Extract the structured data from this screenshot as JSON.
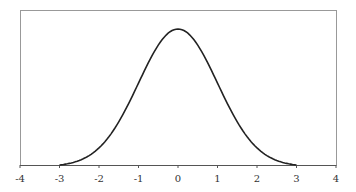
{
  "chart_data": {
    "type": "line",
    "title": "",
    "xlabel": "",
    "ylabel": "",
    "xlim": [
      -4,
      4
    ],
    "xticks": [
      -4,
      -3,
      -2,
      -1,
      0,
      1,
      2,
      3,
      4
    ],
    "xtick_labels": [
      "-4",
      "-3",
      "-2",
      "-1",
      "0",
      "1",
      "2",
      "3",
      "4"
    ],
    "grid": false,
    "legend": null,
    "series": [
      {
        "name": "standard normal density (truncated to [-3, 3])",
        "x": [
          -3,
          -2.5,
          -2,
          -1.5,
          -1,
          -0.5,
          0,
          0.5,
          1,
          1.5,
          2,
          2.5,
          3
        ],
        "y": [
          0.0044,
          0.0175,
          0.054,
          0.1295,
          0.242,
          0.3521,
          0.3989,
          0.3521,
          0.242,
          0.1295,
          0.054,
          0.0175,
          0.0044
        ]
      }
    ],
    "colors": {
      "curve": "#222222",
      "frame": "#999999",
      "axis": "#555555"
    }
  }
}
